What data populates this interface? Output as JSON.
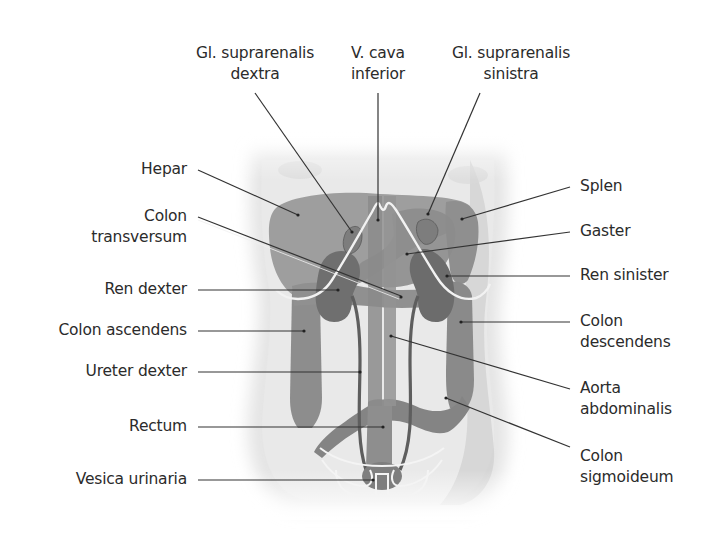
{
  "figure": {
    "type": "anatomical-diagram",
    "colors": {
      "background": "#ffffff",
      "skin": "#e6e6e6",
      "organ_light": "#9a9a9a",
      "organ_mid": "#8a8a8a",
      "organ_dark": "#6e6e6e",
      "outline": "#f4f4f4",
      "leader": "#333333",
      "text": "#2b2b2b"
    }
  },
  "labels_top": [
    {
      "id": "gl-suprarenalis-dextra",
      "line1": "Gl. suprarenalis",
      "line2": "dextra"
    },
    {
      "id": "v-cava-inferior",
      "line1": "V. cava",
      "line2": "inferior"
    },
    {
      "id": "gl-suprarenalis-sinistra",
      "line1": "Gl. suprarenalis",
      "line2": "sinistra"
    }
  ],
  "labels_left": [
    {
      "id": "hepar",
      "line1": "Hepar"
    },
    {
      "id": "colon-transversum",
      "line1": "Colon",
      "line2": "transversum"
    },
    {
      "id": "ren-dexter",
      "line1": "Ren dexter"
    },
    {
      "id": "colon-ascendens",
      "line1": "Colon ascendens"
    },
    {
      "id": "ureter-dexter",
      "line1": "Ureter dexter"
    },
    {
      "id": "rectum",
      "line1": "Rectum"
    },
    {
      "id": "vesica-urinaria",
      "line1": "Vesica urinaria"
    }
  ],
  "labels_right": [
    {
      "id": "splen",
      "line1": "Splen"
    },
    {
      "id": "gaster",
      "line1": "Gaster"
    },
    {
      "id": "ren-sinister",
      "line1": "Ren sinister"
    },
    {
      "id": "colon-descendens",
      "line1": "Colon",
      "line2": "descendens"
    },
    {
      "id": "aorta-abdominalis",
      "line1": "Aorta",
      "line2": "abdominalis"
    },
    {
      "id": "colon-sigmoideum",
      "line1": "Colon",
      "line2": "sigmoideum"
    }
  ]
}
